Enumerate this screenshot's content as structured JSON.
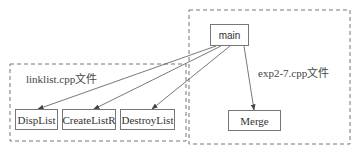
{
  "groups": {
    "left": {
      "label": "linklist.cpp文件"
    },
    "right": {
      "label": "exp2-7.cpp文件"
    }
  },
  "nodes": {
    "main": "main",
    "displist": "DispList",
    "createlistr": "CreateListR",
    "destroylist": "DestroyList",
    "merge": "Merge"
  },
  "edges": [
    {
      "from": "main",
      "to": "DispList"
    },
    {
      "from": "main",
      "to": "CreateListR"
    },
    {
      "from": "main",
      "to": "DestroyList"
    },
    {
      "from": "main",
      "to": "Merge"
    }
  ],
  "colors": {
    "line": "#666666",
    "box": "#777777"
  }
}
